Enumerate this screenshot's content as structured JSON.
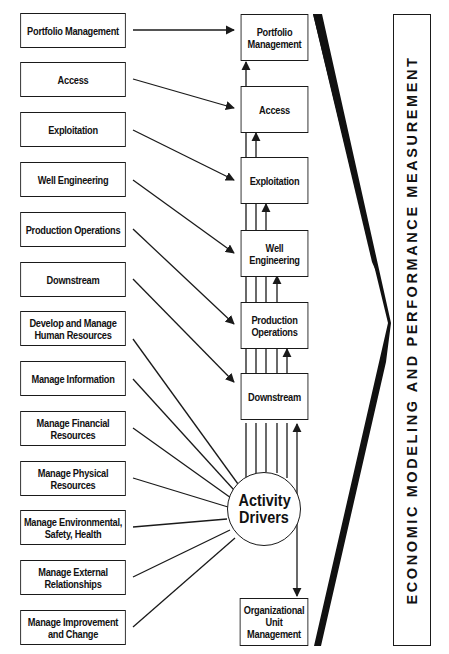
{
  "functions": [
    {
      "label": "Portfolio Management"
    },
    {
      "label": "Access"
    },
    {
      "label": "Exploitation"
    },
    {
      "label": "Well Engineering"
    },
    {
      "label": "Production Operations"
    },
    {
      "label": "Downstream"
    },
    {
      "label": "Develop and Manage Human Resources"
    },
    {
      "label": "Manage Information"
    },
    {
      "label": "Manage Financial Resources"
    },
    {
      "label": "Manage Physical Resources"
    },
    {
      "label": "Manage Environmental, Safety, Health"
    },
    {
      "label": "Manage External Relationships"
    },
    {
      "label": "Manage Improvement and Change"
    }
  ],
  "processes": [
    {
      "label": "Portfolio Management"
    },
    {
      "label": "Access"
    },
    {
      "label": "Exploitation"
    },
    {
      "label": "Well Engineering"
    },
    {
      "label": "Production Operations"
    },
    {
      "label": "Downstream"
    }
  ],
  "hub": {
    "label": "Activity Drivers"
  },
  "org_unit": {
    "label": "Organizational Unit Management"
  },
  "banner": {
    "label": "ECONOMIC MODELING AND PERFORMANCE MEASUREMENT"
  },
  "colors": {
    "ink": "#1a1a1a",
    "background": "#ffffff"
  }
}
